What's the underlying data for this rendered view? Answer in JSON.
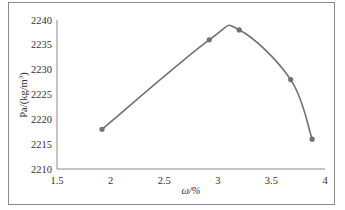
{
  "chart_data": {
    "type": "line",
    "title": "",
    "xlabel": "ω/%",
    "ylabel": "Pa/(kg/m³)",
    "ylabel_base": "Pa/(kg/m",
    "ylabel_sup": "3",
    "ylabel_close": ")",
    "xlim": [
      1.5,
      4
    ],
    "ylim": [
      2210,
      2240
    ],
    "x_ticks": [
      "1.5",
      "2",
      "2.5",
      "3",
      "3.5",
      "4"
    ],
    "y_ticks": [
      "2210",
      "2215",
      "2220",
      "2225",
      "2230",
      "2235",
      "2240"
    ],
    "grid": false,
    "legend": null,
    "smooth": true,
    "series": [
      {
        "name": "Pa",
        "color": "#707070",
        "x": [
          1.92,
          2.92,
          3.2,
          3.68,
          3.88
        ],
        "y": [
          2218,
          2236,
          2238,
          2228,
          2216
        ]
      }
    ]
  }
}
